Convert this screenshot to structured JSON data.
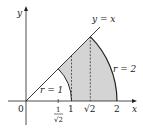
{
  "diagram": {
    "axes": {
      "x_label": "x",
      "y_label": "y",
      "origin_label": "0"
    },
    "curves": {
      "line_label": "y = x",
      "inner_arc_label": "r = 1",
      "outer_arc_label": "r = 2"
    },
    "ticks": {
      "inv_sqrt2_num": "1",
      "inv_sqrt2_den": "√2",
      "one": "1",
      "sqrt2": "√2",
      "two": "2"
    },
    "colors": {
      "shaded_region": "#d4d4d4",
      "stroke": "#222222"
    }
  }
}
